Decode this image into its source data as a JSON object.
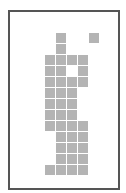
{
  "figure": {
    "frame_color": "#555555",
    "cell_color": "#b4b4b4",
    "background_color": "#ffffff",
    "grid_origin": {
      "x": 45,
      "y": 33
    },
    "cell_pitch": 11,
    "cell_size": 10
  },
  "cells": [
    {
      "row": 0,
      "col": 1
    },
    {
      "row": 0,
      "col": 4
    },
    {
      "row": 1,
      "col": 1
    },
    {
      "row": 2,
      "col": 0
    },
    {
      "row": 2,
      "col": 1
    },
    {
      "row": 2,
      "col": 2
    },
    {
      "row": 2,
      "col": 3
    },
    {
      "row": 3,
      "col": 0
    },
    {
      "row": 3,
      "col": 1
    },
    {
      "row": 3,
      "col": 3
    },
    {
      "row": 4,
      "col": 0
    },
    {
      "row": 4,
      "col": 1
    },
    {
      "row": 4,
      "col": 2
    },
    {
      "row": 4,
      "col": 3
    },
    {
      "row": 5,
      "col": 0
    },
    {
      "row": 5,
      "col": 1
    },
    {
      "row": 5,
      "col": 2
    },
    {
      "row": 6,
      "col": 0
    },
    {
      "row": 6,
      "col": 1
    },
    {
      "row": 6,
      "col": 2
    },
    {
      "row": 7,
      "col": 0
    },
    {
      "row": 7,
      "col": 1
    },
    {
      "row": 7,
      "col": 2
    },
    {
      "row": 8,
      "col": 0
    },
    {
      "row": 8,
      "col": 1
    },
    {
      "row": 8,
      "col": 2
    },
    {
      "row": 8,
      "col": 3
    },
    {
      "row": 9,
      "col": 1
    },
    {
      "row": 9,
      "col": 2
    },
    {
      "row": 9,
      "col": 3
    },
    {
      "row": 10,
      "col": 1
    },
    {
      "row": 10,
      "col": 2
    },
    {
      "row": 10,
      "col": 3
    },
    {
      "row": 11,
      "col": 1
    },
    {
      "row": 11,
      "col": 2
    },
    {
      "row": 11,
      "col": 3
    },
    {
      "row": 12,
      "col": 0
    },
    {
      "row": 12,
      "col": 1
    },
    {
      "row": 12,
      "col": 2
    },
    {
      "row": 12,
      "col": 3
    }
  ]
}
